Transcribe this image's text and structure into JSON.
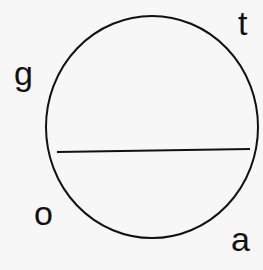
{
  "diagram": {
    "labels": {
      "t": "t",
      "g": "g",
      "o": "o",
      "a": "a"
    },
    "stroke_color": "#111111",
    "background": "#f7f7f7"
  }
}
